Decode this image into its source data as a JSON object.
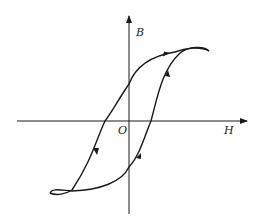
{
  "diagram": {
    "type": "hysteresis-loop",
    "axes": {
      "y_label": "B",
      "x_label": "H",
      "origin_label": "O"
    },
    "colors": {
      "line": "#1a1a1a",
      "background": "#ffffff"
    }
  }
}
